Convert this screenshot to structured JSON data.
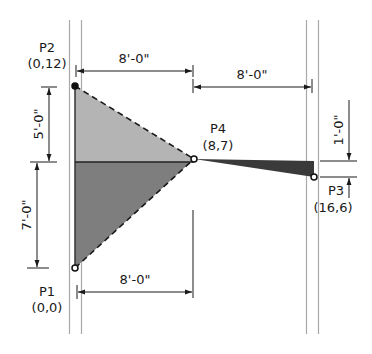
{
  "diagram": {
    "type": "structural-geometry",
    "colors": {
      "upper_fill": "#b4b4b4",
      "lower_fill": "#7e7e7e",
      "tail_fill": "#3a3a3a",
      "guide_line": "#a8a8a8",
      "ink": "#1a1a1a"
    },
    "points": [
      {
        "id": "P1",
        "name": "P1",
        "coords": "(0,0)"
      },
      {
        "id": "P2",
        "name": "P2",
        "coords": "(0,12)"
      },
      {
        "id": "P3",
        "name": "P3",
        "coords": "(16,6)"
      },
      {
        "id": "P4",
        "name": "P4",
        "coords": "(8,7)"
      }
    ],
    "dimensions": {
      "top_left": "8'-0\"",
      "top_right": "8'-0\"",
      "bottom": "8'-0\"",
      "left_upper": "5'-0\"",
      "left_lower": "7'-0\"",
      "right_offset": "1'-0\""
    }
  }
}
